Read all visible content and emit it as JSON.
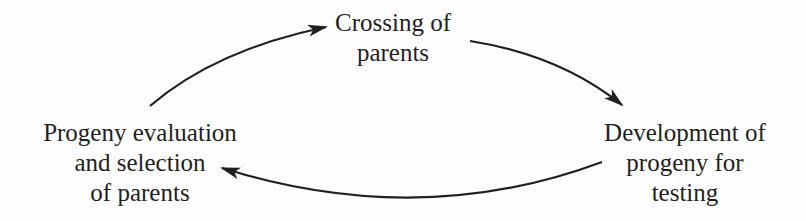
{
  "diagram": {
    "type": "cycle",
    "nodes": [
      {
        "id": "crossing",
        "lines": [
          "Crossing of",
          "parents"
        ]
      },
      {
        "id": "development",
        "lines": [
          "Development of",
          "progeny for",
          "testing"
        ]
      },
      {
        "id": "evaluation",
        "lines": [
          "Progeny evaluation",
          "and selection",
          "of parents"
        ]
      }
    ],
    "edges": [
      {
        "from": "evaluation",
        "to": "crossing"
      },
      {
        "from": "crossing",
        "to": "development"
      },
      {
        "from": "development",
        "to": "evaluation"
      }
    ],
    "colors": {
      "ink": "#231f20",
      "background": "#fefefe"
    }
  }
}
